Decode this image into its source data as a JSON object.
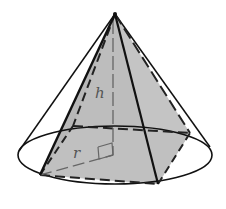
{
  "diagram": {
    "labels": {
      "height": "h",
      "radius": "r"
    },
    "colors": {
      "stroke": "#111111",
      "fill": "#bdbdbd",
      "dashed": "#222222",
      "label": "#555555",
      "background": "#ffffff"
    },
    "geometry": {
      "apex": [
        115,
        14
      ],
      "base_center": [
        113,
        155
      ],
      "ellipse": {
        "cx": 115,
        "cy": 155,
        "rx": 97,
        "ry": 29
      },
      "square": {
        "front_left": [
          40,
          175
        ],
        "front_right": [
          158,
          184
        ],
        "back_right": [
          190,
          133
        ],
        "back_left": [
          73,
          126
        ]
      }
    }
  }
}
